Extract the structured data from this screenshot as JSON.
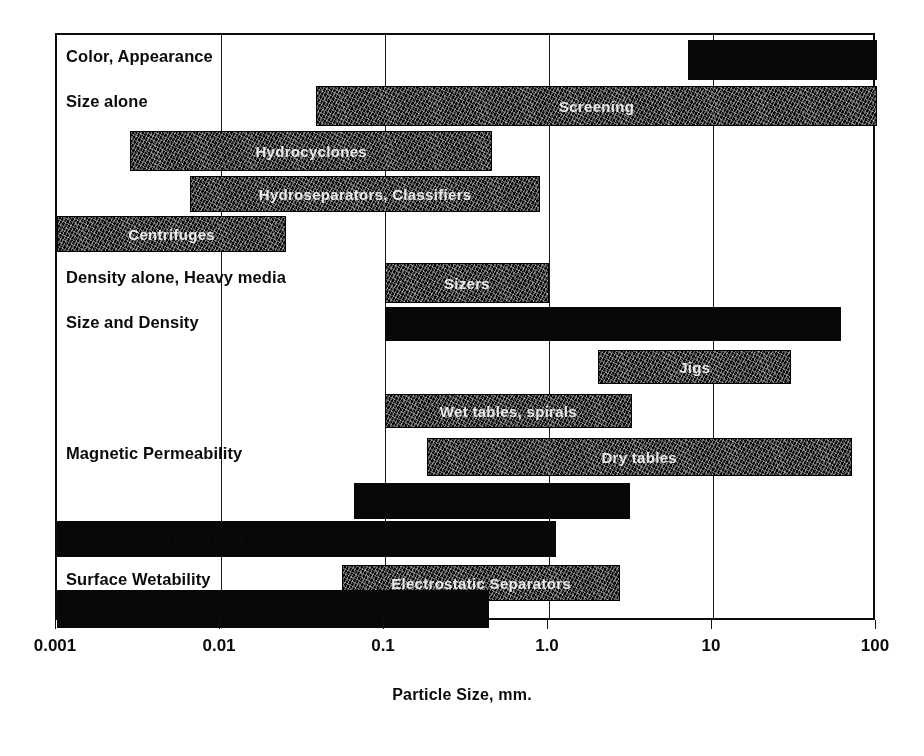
{
  "chart_data": {
    "type": "bar",
    "title": "",
    "xlabel": "Particle Size, mm.",
    "ylabel": "",
    "orientation": "horizontal",
    "xscale": "log",
    "xlim": [
      0.001,
      100
    ],
    "xticks": [
      "0.001",
      "0.01",
      "0.1",
      "1.0",
      "10",
      "100"
    ],
    "xtick_values": [
      0.001,
      0.01,
      0.1,
      1.0,
      10,
      100
    ],
    "grid": "vertical gridlines at each decade",
    "legend": "none",
    "categories": [
      "Color, Appearance",
      "Size alone",
      "",
      "",
      "",
      "Density alone, Heavy media",
      "Size and Density",
      "",
      "",
      "Magnetic Permeability",
      "",
      "Electrical Conductivity",
      "Surface Wetability",
      ""
    ],
    "bars": [
      {
        "label": "Color, Appearance",
        "bar_text": "",
        "x_start": 7.0,
        "x_end": 100.0,
        "style": "solid",
        "row": 0
      },
      {
        "label": "Size alone",
        "bar_text": "Screening",
        "x_start": 0.038,
        "x_end": 100.0,
        "style": "textured",
        "row": 1
      },
      {
        "label": "",
        "bar_text": "Hydrocyclones",
        "x_start": 0.0028,
        "x_end": 0.45,
        "style": "textured",
        "row": 2
      },
      {
        "label": "",
        "bar_text": "Hydroseparators, Classifiers",
        "x_start": 0.0065,
        "x_end": 0.88,
        "style": "textured",
        "row": 3
      },
      {
        "label": "",
        "bar_text": "Centrifuges",
        "x_start": 0.001,
        "x_end": 0.025,
        "style": "textured",
        "row": 4
      },
      {
        "label": "",
        "bar_text": "Sizers",
        "x_start": 0.1,
        "x_end": 1.0,
        "style": "textured",
        "row": 4
      },
      {
        "label": "Density alone, Heavy media",
        "bar_text": "",
        "x_start": 0.1,
        "x_end": 60.0,
        "style": "solid",
        "row": 5
      },
      {
        "label": "Size and Density",
        "bar_text": "Jigs",
        "x_start": 2.0,
        "x_end": 30.0,
        "style": "textured",
        "row": 6
      },
      {
        "label": "",
        "bar_text": "Wet tables, spirals",
        "x_start": 0.1,
        "x_end": 3.2,
        "style": "textured",
        "row": 7
      },
      {
        "label": "",
        "bar_text": "Dry tables",
        "x_start": 0.18,
        "x_end": 70.0,
        "style": "textured",
        "row": 8
      },
      {
        "label": "Magnetic Permeability",
        "bar_text": "",
        "x_start": 0.065,
        "x_end": 3.1,
        "style": "solid",
        "row": 9
      },
      {
        "label": "",
        "bar_text": "",
        "x_start": 0.001,
        "x_end": 1.1,
        "style": "solid",
        "row": 10
      },
      {
        "label": "Electrical Conductivity",
        "bar_text": "Electrostatic Separators",
        "x_start": 0.055,
        "x_end": 2.7,
        "style": "textured",
        "row": 11
      },
      {
        "label": "Surface Wetability",
        "bar_text": "",
        "x_start": 0.001,
        "x_end": 0.43,
        "style": "solid",
        "row": 13
      }
    ]
  },
  "axis": {
    "title": "Particle Size, mm."
  }
}
